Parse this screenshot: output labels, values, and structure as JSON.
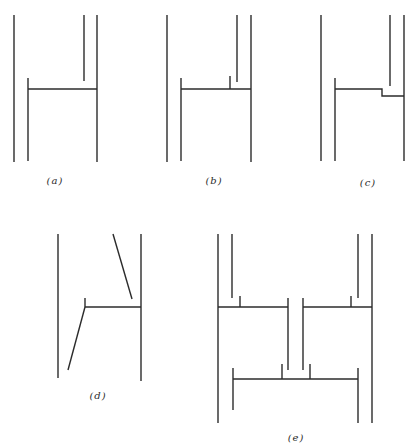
{
  "figure": {
    "panels": [
      {
        "id": "a",
        "label": "(a)",
        "label_pos": [
          55,
          175
        ]
      },
      {
        "id": "b",
        "label": "(b)",
        "label_pos": [
          214,
          175
        ]
      },
      {
        "id": "c",
        "label": "(c)",
        "label_pos": [
          368,
          177
        ]
      },
      {
        "id": "d",
        "label": "(d)",
        "label_pos": [
          98,
          390
        ]
      },
      {
        "id": "e",
        "label": "(e)",
        "label_pos": [
          296,
          432
        ]
      }
    ],
    "line_color": "#2b2b2b",
    "background": "#ffffff"
  }
}
